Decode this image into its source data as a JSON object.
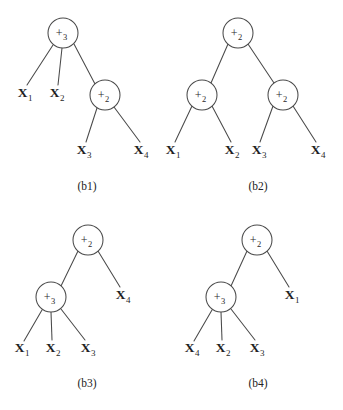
{
  "figure": {
    "background_color": "#ffffff",
    "ink_color": "#4a4a4a",
    "panels": [
      {
        "id": "b1",
        "caption": "(b1)",
        "caption_x": 87,
        "caption_y": 190,
        "nodes": [
          {
            "name": "root",
            "label": "+",
            "subscript": "3",
            "cx": 63,
            "cy": 33,
            "r": 15
          },
          {
            "name": "inner",
            "label": "+",
            "subscript": "2",
            "cx": 105,
            "cy": 95,
            "r": 15
          }
        ],
        "leaves": [
          {
            "name": "x1",
            "label": "X",
            "subscript": "1",
            "x": 25,
            "y": 97
          },
          {
            "name": "x2",
            "label": "X",
            "subscript": "2",
            "x": 57,
            "y": 97
          },
          {
            "name": "x3",
            "label": "X",
            "subscript": "3",
            "x": 84,
            "y": 154
          },
          {
            "name": "x4",
            "label": "X",
            "subscript": "4",
            "x": 141,
            "y": 154
          }
        ],
        "edges": [
          {
            "x1": 53,
            "y1": 45,
            "x2": 27,
            "y2": 85
          },
          {
            "x1": 62,
            "y1": 48,
            "x2": 58,
            "y2": 85
          },
          {
            "x1": 74,
            "y1": 44,
            "x2": 95,
            "y2": 84
          },
          {
            "x1": 97,
            "y1": 108,
            "x2": 86,
            "y2": 142
          },
          {
            "x1": 114,
            "y1": 107,
            "x2": 140,
            "y2": 142
          }
        ]
      },
      {
        "id": "b2",
        "caption": "(b2)",
        "caption_x": 258,
        "caption_y": 190,
        "nodes": [
          {
            "name": "root",
            "label": "+",
            "subscript": "2",
            "cx": 238,
            "cy": 33,
            "r": 15
          },
          {
            "name": "left",
            "label": "+",
            "subscript": "2",
            "cx": 202,
            "cy": 95,
            "r": 15
          },
          {
            "name": "right",
            "label": "+",
            "subscript": "2",
            "cx": 283,
            "cy": 95,
            "r": 15
          }
        ],
        "leaves": [
          {
            "name": "x1",
            "label": "X",
            "subscript": "1",
            "x": 173,
            "y": 154
          },
          {
            "name": "x2",
            "label": "X",
            "subscript": "2",
            "x": 232,
            "y": 154
          },
          {
            "name": "x3",
            "label": "X",
            "subscript": "3",
            "x": 259,
            "y": 154
          },
          {
            "name": "x4",
            "label": "X",
            "subscript": "4",
            "x": 318,
            "y": 154
          }
        ],
        "edges": [
          {
            "x1": 228,
            "y1": 44,
            "x2": 211,
            "y2": 83
          },
          {
            "x1": 248,
            "y1": 44,
            "x2": 274,
            "y2": 83
          },
          {
            "x1": 192,
            "y1": 106,
            "x2": 175,
            "y2": 142
          },
          {
            "x1": 212,
            "y1": 106,
            "x2": 231,
            "y2": 142
          },
          {
            "x1": 273,
            "y1": 106,
            "x2": 260,
            "y2": 142
          },
          {
            "x1": 293,
            "y1": 106,
            "x2": 316,
            "y2": 142
          }
        ]
      },
      {
        "id": "b3",
        "caption": "(b3)",
        "caption_x": 87,
        "caption_y": 387,
        "nodes": [
          {
            "name": "root",
            "label": "+",
            "subscript": "2",
            "cx": 88,
            "cy": 240,
            "r": 15
          },
          {
            "name": "inner",
            "label": "+",
            "subscript": "3",
            "cx": 51,
            "cy": 297,
            "r": 15
          }
        ],
        "leaves": [
          {
            "name": "x1",
            "label": "X",
            "subscript": "1",
            "x": 22,
            "y": 352
          },
          {
            "name": "x2",
            "label": "X",
            "subscript": "2",
            "x": 53,
            "y": 352
          },
          {
            "name": "x3",
            "label": "X",
            "subscript": "3",
            "x": 88,
            "y": 352
          },
          {
            "name": "x4",
            "label": "X",
            "subscript": "4",
            "x": 123,
            "y": 299
          }
        ],
        "edges": [
          {
            "x1": 78,
            "y1": 251,
            "x2": 61,
            "y2": 286
          },
          {
            "x1": 98,
            "y1": 251,
            "x2": 120,
            "y2": 287
          },
          {
            "x1": 42,
            "y1": 310,
            "x2": 24,
            "y2": 341
          },
          {
            "x1": 51,
            "y1": 312,
            "x2": 52,
            "y2": 340
          },
          {
            "x1": 61,
            "y1": 309,
            "x2": 85,
            "y2": 340
          }
        ]
      },
      {
        "id": "b4",
        "caption": "(b4)",
        "caption_x": 258,
        "caption_y": 387,
        "nodes": [
          {
            "name": "root",
            "label": "+",
            "subscript": "2",
            "cx": 257,
            "cy": 240,
            "r": 15
          },
          {
            "name": "inner",
            "label": "+",
            "subscript": "3",
            "cx": 221,
            "cy": 297,
            "r": 15
          }
        ],
        "leaves": [
          {
            "name": "x4",
            "label": "X",
            "subscript": "4",
            "x": 192,
            "y": 352
          },
          {
            "name": "x2",
            "label": "X",
            "subscript": "2",
            "x": 223,
            "y": 352
          },
          {
            "name": "x3",
            "label": "X",
            "subscript": "3",
            "x": 257,
            "y": 352
          },
          {
            "name": "x1",
            "label": "X",
            "subscript": "1",
            "x": 292,
            "y": 299
          }
        ],
        "edges": [
          {
            "x1": 247,
            "y1": 251,
            "x2": 231,
            "y2": 286
          },
          {
            "x1": 267,
            "y1": 251,
            "x2": 289,
            "y2": 287
          },
          {
            "x1": 212,
            "y1": 310,
            "x2": 194,
            "y2": 341
          },
          {
            "x1": 221,
            "y1": 312,
            "x2": 222,
            "y2": 340
          },
          {
            "x1": 231,
            "y1": 309,
            "x2": 255,
            "y2": 340
          }
        ]
      }
    ]
  }
}
